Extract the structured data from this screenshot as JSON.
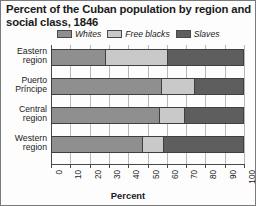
{
  "title": "Percent of the Cuban population by region and social class, 1846",
  "colors": {
    "whites": "#8f8f8f",
    "free_blacks": "#c9c9c9",
    "slaves": "#5e5e5e",
    "outline": "#3f3f3f",
    "grid": "#b9b9b9",
    "text": "#1b1b1b"
  },
  "legend": [
    {
      "label": "Whites",
      "key": "whites"
    },
    {
      "label": "Free blacks",
      "key": "free_blacks"
    },
    {
      "label": "Slaves",
      "key": "slaves"
    }
  ],
  "chart_data": {
    "type": "bar",
    "orientation": "horizontal",
    "stacked": true,
    "title": "Percent of the Cuban population by region and social class, 1846",
    "xlabel": "Percent",
    "ylabel": "",
    "xlim": [
      0,
      100
    ],
    "grid": true,
    "legend_position": "top",
    "categories": [
      "Eastern region",
      "Puerto Príncipe",
      "Central region",
      "Western region"
    ],
    "tick_labels": [
      "0",
      "10",
      "20",
      "30",
      "40",
      "50",
      "60",
      "70",
      "80",
      "90",
      "100"
    ],
    "tick_values": [
      0,
      10,
      20,
      30,
      40,
      50,
      60,
      70,
      80,
      90,
      100
    ],
    "series": [
      {
        "name": "Whites",
        "values": [
          28,
          57,
          56,
          47
        ]
      },
      {
        "name": "Free blacks",
        "values": [
          32,
          17,
          13,
          11
        ]
      },
      {
        "name": "Slaves",
        "values": [
          40,
          26,
          31,
          42
        ]
      }
    ]
  }
}
